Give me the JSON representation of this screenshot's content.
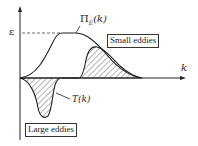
{
  "diagram": {
    "y_axis_label": "ε",
    "x_axis_label": "k",
    "curve_pi_label": "Π",
    "curve_pi_subscript": "E",
    "curve_pi_arg": "(k)",
    "curve_t_label": "T(k)",
    "box_small": "Small eddies",
    "box_large": "Large eddies"
  },
  "colors": {
    "stroke": "#222222",
    "hatch": "#444444"
  }
}
